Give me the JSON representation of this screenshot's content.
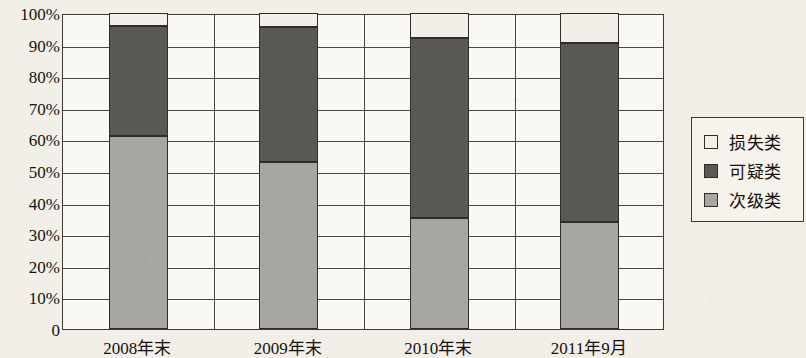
{
  "chart_data": {
    "type": "bar",
    "stacked": true,
    "title": "",
    "subtitle": "",
    "xlabel": "",
    "ylabel": "",
    "categories": [
      "2008年末",
      "2009年末",
      "2010年末",
      "2011年9月"
    ],
    "series": [
      {
        "name": "次级类",
        "color": "#a8a6a1",
        "values": [
          61,
          53,
          35,
          34
        ]
      },
      {
        "name": "可疑类",
        "color": "#5a5855",
        "values": [
          35,
          42.5,
          57,
          56.5
        ]
      },
      {
        "name": "损失类",
        "color": "#f2efe9",
        "values": [
          4,
          4.5,
          8,
          9.5
        ]
      }
    ],
    "stack_order_bottom_to_top": [
      "次级类",
      "可疑类",
      "损失类"
    ],
    "cumulative_tops": [
      {
        "category": "2008年末",
        "sub_standard_top": 61,
        "doubtful_top": 96,
        "loss_top": 100
      },
      {
        "category": "2009年末",
        "sub_standard_top": 53,
        "doubtful_top": 95.5,
        "loss_top": 100
      },
      {
        "category": "2010年末",
        "sub_standard_top": 35,
        "doubtful_top": 92,
        "loss_top": 100
      },
      {
        "category": "2011年9月",
        "sub_standard_top": 34,
        "doubtful_top": 90.5,
        "loss_top": 100
      }
    ],
    "ylim": [
      0,
      100
    ],
    "ytick_values": [
      0,
      10,
      20,
      30,
      40,
      50,
      60,
      70,
      80,
      90,
      100
    ],
    "ytick_labels": [
      "0",
      "10%",
      "20%",
      "30%",
      "40%",
      "50%",
      "60%",
      "70%",
      "80%",
      "90%",
      "100%"
    ],
    "grid": true,
    "grid_axis": "both",
    "legend_position": "right",
    "legend_entries": [
      {
        "label": "损失类",
        "color": "#f2efe9"
      },
      {
        "label": "可疑类",
        "color": "#5a5855"
      },
      {
        "label": "次级类",
        "color": "#a8a6a1"
      }
    ],
    "colors": {
      "sub_standard": "#a8a6a1",
      "doubtful": "#5a5855",
      "loss": "#f2efe9",
      "axis": "#3c3a36",
      "background": "#f2efe9",
      "plot_background": "#faf8f3",
      "text": "#14120f"
    }
  }
}
